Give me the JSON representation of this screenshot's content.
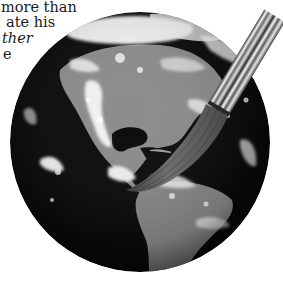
{
  "caption": {
    "lines": [
      {
        "text": "more than",
        "italic": false
      },
      {
        "text": "ate his",
        "italic": false
      },
      {
        "text": "ther",
        "italic": true
      },
      {
        "text": "e",
        "italic": false
      }
    ]
  },
  "illustration": {
    "subject": "Earth globe (Americas view) with a paintbrush painting on it",
    "style": "grayscale photograph",
    "colors": {
      "ocean": "#0a0a0a",
      "land": "#8a8a8a",
      "cloud": "#f2f2f2",
      "bristles": "#5a5a5a",
      "ferrule_light": "#eeeeee",
      "ferrule_dark": "#3a3a3a"
    }
  }
}
